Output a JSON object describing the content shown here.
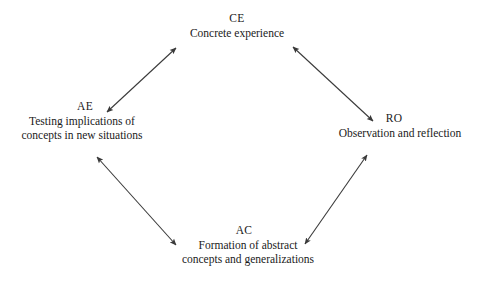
{
  "diagram": {
    "line_color": "#3a3a3a",
    "background_color": "#ffffff",
    "nodes": [
      {
        "id": "ce",
        "code": "CE",
        "label": "Concrete experience",
        "position": "top"
      },
      {
        "id": "ae",
        "code": "AE",
        "label": "Testing implications of\nconcepts in new situations",
        "position": "left"
      },
      {
        "id": "ro",
        "code": "RO",
        "label": "Observation and reflection",
        "position": "right"
      },
      {
        "id": "ac",
        "code": "AC",
        "label": "Formation of abstract\nconcepts and generalizations",
        "position": "bottom"
      }
    ],
    "edges": [
      {
        "id": "ae-ce",
        "from": "ae",
        "to": "ce",
        "arrowheads": "both",
        "x1": 107,
        "y1": 112,
        "x2": 176,
        "y2": 48
      },
      {
        "id": "ce-ro",
        "from": "ce",
        "to": "ro",
        "arrowheads": "both",
        "x1": 293,
        "y1": 47,
        "x2": 373,
        "y2": 121
      },
      {
        "id": "ae-ac",
        "from": "ae",
        "to": "ac",
        "arrowheads": "both",
        "x1": 97,
        "y1": 157,
        "x2": 176,
        "y2": 245
      },
      {
        "id": "ac-ro",
        "from": "ac",
        "to": "ro",
        "arrowheads": "both",
        "x1": 305,
        "y1": 244,
        "x2": 367,
        "y2": 155
      }
    ]
  }
}
